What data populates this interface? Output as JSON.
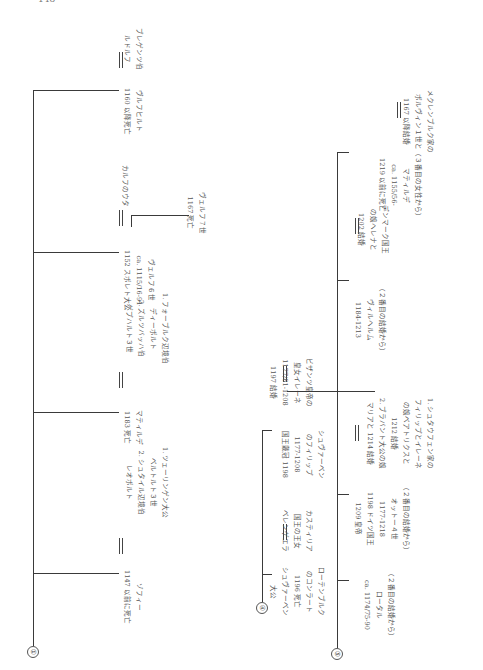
{
  "page": {
    "number": "148",
    "orientation": "rotated 90° counter-clockwise"
  },
  "sections": [
    {
      "marker": "①",
      "entries": [
        {
          "person": [
            "ゾフィー",
            "1147 以前に死亡"
          ],
          "spouse": [
            "1. ツェーリンゲン大公",
            "ベルトルト３世",
            "2. シュタイル辺境伯",
            "レオポルト"
          ]
        },
        {
          "person": [
            "マティルデ",
            "1183 死亡"
          ],
          "spouse": [
            "1. フォーブルク辺境伯",
            "ディーポルト",
            "2. ズルツバッハ伯",
            "ゲプハルト３世"
          ]
        },
        {
          "person": [
            "ヴェルフ６世",
            "ca. 1115/16-91",
            "1152 スポレト大公"
          ],
          "spouse": [
            "カルフのウタ"
          ],
          "child": [
            "ヴェルフ７世",
            "1167 死亡"
          ]
        },
        {
          "person": [
            "ヴルフヒルト",
            "1160 以降死亡"
          ],
          "spouse": [
            "ブレゲンツ伯",
            "ルドルフ"
          ]
        }
      ]
    },
    {
      "marker": "④",
      "entries": [
        {
          "person": [
            "ローテンブルク",
            "のコンラート",
            "1196 死亡",
            "シュヴァーベン",
            "大公"
          ],
          "spouse": [
            "カスティリア",
            "国王の王女",
            "ベレンゲエラ"
          ]
        },
        {
          "person": [
            "シュヴァーベン",
            "のフィリップ",
            "1177-1208",
            "国王戴冠 1198"
          ],
          "spouse": [
            "ビザンツ皇帝の",
            "皇女イレーネ",
            "1177/81-1208",
            "1197 結婚"
          ]
        }
      ]
    },
    {
      "marker": "⑤",
      "entries": [
        {
          "person": [
            "（２番目の結婚から）",
            "ロータル",
            "ca. 1174/75-90"
          ]
        },
        {
          "person": [
            "（２番目の結婚から）",
            "オットー４世",
            "1177-1218",
            "1198 ドイツ国王",
            "1209 皇帝"
          ],
          "spouse": [
            "1. シュタウフェン家の",
            "フィリップとイレーネ",
            "の娘ベアトリクスと",
            "1212 結婚",
            "2. ブラバント大公の娘",
            "マリアと 1214 結婚"
          ]
        },
        {
          "person": [
            "（２番目の結婚から）",
            "ヴィルヘルム",
            "1184-1213"
          ],
          "spouse": [
            "デンマーク国王",
            "の娘ヘレナと",
            "1202 結婚"
          ]
        },
        {
          "person": [
            "（３番目の女性から）",
            "マティルデ",
            "ca. 1155/56-",
            "1219 以前に死亡"
          ],
          "spouse": [
            "メクレンブルク家の",
            "ボルヴィン１世と",
            "1167 以降結婚"
          ]
        }
      ]
    }
  ]
}
